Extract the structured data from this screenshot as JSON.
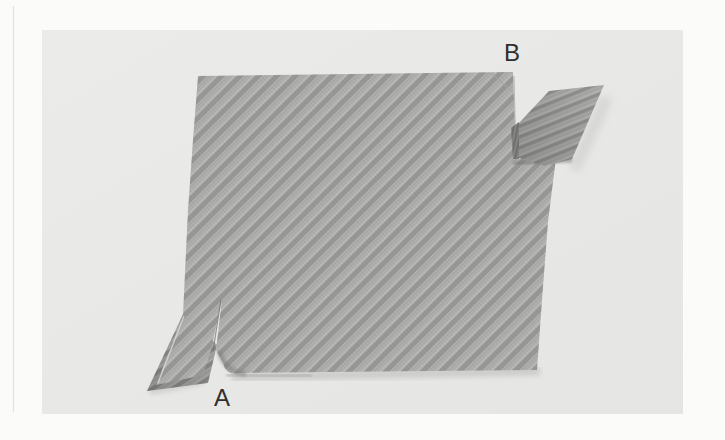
{
  "figure": {
    "type": "black-and-white textbook photograph",
    "labels": {
      "a": "A",
      "b": "B"
    }
  },
  "palette": {
    "page_bg": "#fbfbf9",
    "page_rule": "#e1e1df",
    "photo_bg_light": "#ebebe9",
    "photo_bg_dark": "#e5e5e3",
    "photo_bg": "#e9e9e7",
    "stripe_light": "#b2b2b0",
    "stripe_dark": "#979795",
    "strip_shadow": "#757573",
    "ground_shadow": "#bcbcba",
    "label_color": "#2f2f2f"
  }
}
